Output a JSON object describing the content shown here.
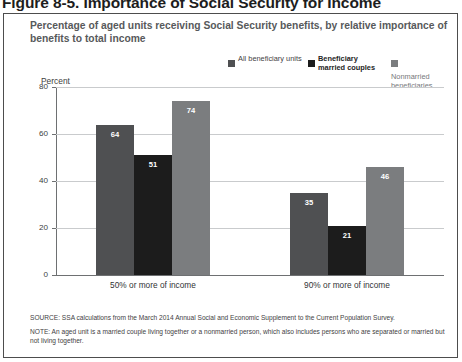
{
  "figure_heading": "Figure 8-5. Importance of Social Security for Income",
  "subtitle": "Percentage of aged units receiving Social Security benefits, by relative importance of benefits to total income",
  "legend": [
    {
      "label": "All beneficiary units",
      "color": "#4f5052"
    },
    {
      "label": "Beneficiary married couples",
      "color": "#1c1c1c"
    },
    {
      "label": "Nonmarried beneficiaries",
      "color": "#7b7d7f"
    }
  ],
  "axis": {
    "y_title": "Percent",
    "y_ticks": [
      "0",
      "20",
      "40",
      "60",
      "80"
    ],
    "y_min": 0,
    "y_max": 80
  },
  "notes": {
    "source": "SOURCE: SSA calculations from the March 2014 Annual Social and Economic Supplement to the Current Population Survey.",
    "note": "NOTE: An aged unit is a married couple living together or a nonmarried person, which also includes persons who are separated or married but not living together."
  },
  "chart_data": {
    "type": "bar",
    "title": "Percentage of aged units receiving Social Security benefits, by relative importance of benefits to total income",
    "xlabel": "",
    "ylabel": "Percent",
    "ylim": [
      0,
      80
    ],
    "yticks": [
      0,
      20,
      40,
      60,
      80
    ],
    "grid": true,
    "legend_position": "top-right",
    "categories": [
      "50% or more of income",
      "90% or more of income"
    ],
    "series": [
      {
        "name": "All beneficiary units",
        "color": "#4f5052",
        "values": [
          64,
          35
        ]
      },
      {
        "name": "Beneficiary married couples",
        "color": "#1c1c1c",
        "values": [
          51,
          21
        ]
      },
      {
        "name": "Nonmarried beneficiaries",
        "color": "#7b7d7f",
        "values": [
          74,
          46
        ]
      }
    ],
    "data_labels": [
      [
        64,
        51,
        74
      ],
      [
        35,
        21,
        46
      ]
    ]
  }
}
